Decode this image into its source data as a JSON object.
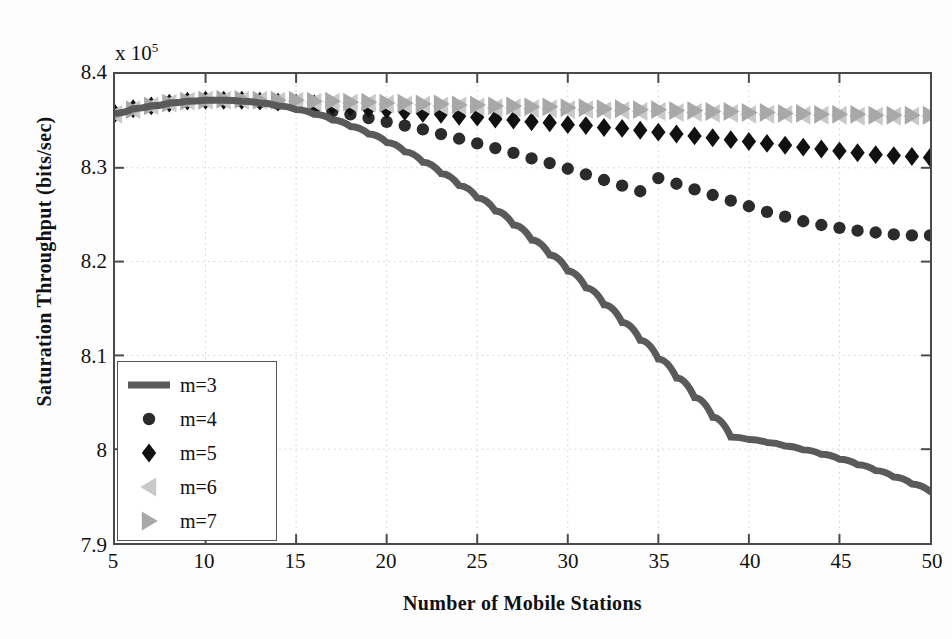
{
  "chart_data": {
    "type": "line",
    "title": "",
    "xlabel": "Number of Mobile Stations",
    "ylabel": "Saturation Throughput  (bits/sec)",
    "y_exponent_label": "x 10",
    "y_exponent": "5",
    "y_scale": 100000,
    "xlim": [
      5,
      50
    ],
    "ylim": [
      7.9,
      8.4
    ],
    "xticks": [
      5,
      10,
      15,
      20,
      25,
      30,
      35,
      40,
      45,
      50
    ],
    "yticks": [
      "7.9",
      "8",
      "8.1",
      "8.2",
      "8.3",
      "8.4"
    ],
    "grid": true,
    "grid_style": "dotted",
    "legend_position": "lower left",
    "x": [
      5,
      6,
      7,
      8,
      9,
      10,
      11,
      12,
      13,
      14,
      15,
      16,
      17,
      18,
      19,
      20,
      21,
      22,
      23,
      24,
      25,
      26,
      27,
      28,
      29,
      30,
      31,
      32,
      33,
      34,
      35,
      36,
      37,
      38,
      39,
      40,
      41,
      42,
      43,
      44,
      45,
      46,
      47,
      48,
      49,
      50
    ],
    "series": [
      {
        "name": "m=3",
        "marker": "none",
        "style": "thick-line",
        "color": "#5a5a5a",
        "values": [
          8.358,
          8.363,
          8.366,
          8.369,
          8.371,
          8.372,
          8.372,
          8.371,
          8.369,
          8.366,
          8.362,
          8.357,
          8.351,
          8.344,
          8.336,
          8.327,
          8.317,
          8.306,
          8.294,
          8.281,
          8.268,
          8.254,
          8.239,
          8.223,
          8.207,
          8.19,
          8.172,
          8.154,
          8.135,
          8.116,
          8.096,
          8.076,
          8.055,
          8.034,
          8.013,
          7.991,
          7.969,
          7.947,
          7.925,
          7.903,
          7.881,
          7.859,
          7.837,
          7.815,
          7.793,
          7.955
        ]
      },
      {
        "name": "m=4",
        "marker": "circle",
        "style": "markers",
        "color": "#2b2b2b",
        "values": [
          8.358,
          8.363,
          8.366,
          8.369,
          8.371,
          8.372,
          8.372,
          8.371,
          8.37,
          8.368,
          8.366,
          8.363,
          8.36,
          8.357,
          8.353,
          8.349,
          8.345,
          8.341,
          8.336,
          8.331,
          8.326,
          8.321,
          8.316,
          8.31,
          8.305,
          8.299,
          8.293,
          8.287,
          8.281,
          8.275,
          8.289,
          8.283,
          8.277,
          8.271,
          8.265,
          8.259,
          8.253,
          8.248,
          8.243,
          8.239,
          8.236,
          8.233,
          8.231,
          8.229,
          8.228,
          8.228
        ]
      },
      {
        "name": "m=5",
        "marker": "diamond",
        "style": "markers",
        "color": "#111111",
        "values": [
          8.358,
          8.363,
          8.366,
          8.369,
          8.371,
          8.372,
          8.372,
          8.372,
          8.371,
          8.37,
          8.369,
          8.368,
          8.366,
          8.365,
          8.363,
          8.362,
          8.36,
          8.358,
          8.357,
          8.355,
          8.354,
          8.352,
          8.351,
          8.349,
          8.348,
          8.346,
          8.345,
          8.343,
          8.342,
          8.34,
          8.338,
          8.336,
          8.334,
          8.332,
          8.33,
          8.328,
          8.326,
          8.324,
          8.322,
          8.32,
          8.318,
          8.316,
          8.314,
          8.313,
          8.312,
          8.311
        ]
      },
      {
        "name": "m=6",
        "marker": "triangle-left",
        "style": "markers",
        "color": "#c9c9c9",
        "values": [
          8.357,
          8.362,
          8.366,
          8.369,
          8.371,
          8.372,
          8.372,
          8.372,
          8.372,
          8.371,
          8.371,
          8.37,
          8.37,
          8.369,
          8.369,
          8.368,
          8.367,
          8.367,
          8.366,
          8.366,
          8.365,
          8.364,
          8.364,
          8.363,
          8.363,
          8.362,
          8.362,
          8.361,
          8.361,
          8.36,
          8.36,
          8.359,
          8.359,
          8.358,
          8.358,
          8.357,
          8.357,
          8.357,
          8.356,
          8.356,
          8.356,
          8.355,
          8.355,
          8.355,
          8.355,
          8.355
        ]
      },
      {
        "name": "m=7",
        "marker": "triangle-right",
        "style": "markers",
        "color": "#a8a8a8",
        "values": [
          8.357,
          8.362,
          8.366,
          8.369,
          8.371,
          8.372,
          8.373,
          8.373,
          8.372,
          8.372,
          8.372,
          8.371,
          8.371,
          8.37,
          8.37,
          8.369,
          8.369,
          8.368,
          8.368,
          8.367,
          8.367,
          8.366,
          8.366,
          8.365,
          8.365,
          8.364,
          8.364,
          8.363,
          8.363,
          8.362,
          8.362,
          8.361,
          8.361,
          8.36,
          8.36,
          8.359,
          8.359,
          8.358,
          8.358,
          8.357,
          8.357,
          8.357,
          8.356,
          8.356,
          8.356,
          8.356
        ]
      }
    ]
  }
}
